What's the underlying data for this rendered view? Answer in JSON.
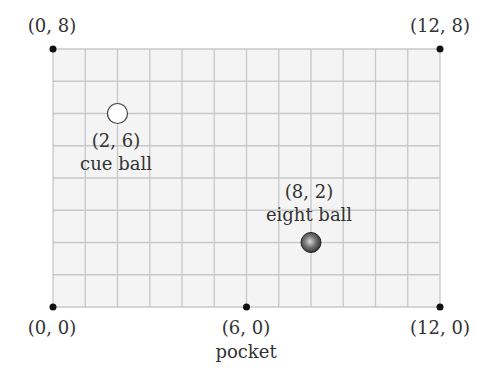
{
  "diagram": {
    "type": "coordinate-grid",
    "grid": {
      "x_min": 0,
      "x_max": 12,
      "y_min": 0,
      "y_max": 8,
      "step": 1,
      "fill": "#f4f4f4",
      "line_color": "#c8c8c8"
    },
    "corners": [
      {
        "label": "(0, 8)",
        "x": 0,
        "y": 8
      },
      {
        "label": "(12, 8)",
        "x": 12,
        "y": 8
      },
      {
        "label": "(0, 0)",
        "x": 0,
        "y": 0
      },
      {
        "label": "(12, 0)",
        "x": 12,
        "y": 0
      }
    ],
    "pocket": {
      "coord_label": "(6, 0)",
      "name": "pocket",
      "x": 6,
      "y": 0
    },
    "cue_ball": {
      "coord_label": "(2, 6)",
      "name": "cue ball",
      "x": 2,
      "y": 6,
      "color": "#ffffff"
    },
    "eight_ball": {
      "coord_label": "(8, 2)",
      "name": "eight ball",
      "x": 8,
      "y": 2,
      "color": "#3a3a3a"
    }
  }
}
